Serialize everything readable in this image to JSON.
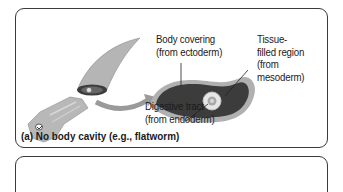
{
  "figure": {
    "panel_a": {
      "caption": "(a) No body cavity (e.g., flatworm)",
      "labels": {
        "body_covering": [
          "Body covering",
          "(from ectoderm)"
        ],
        "tissue_filled": [
          "Tissue-",
          "filled region",
          "(from",
          "mesoderm)"
        ],
        "digestive_tract": [
          "Digestive tract",
          "(from endoderm)"
        ]
      }
    },
    "colors": {
      "ectoderm": "#9a9a9a",
      "mesoderm": "#5a5a5a",
      "endoderm": "#c8c8c8",
      "border": "#3a3a3a"
    }
  }
}
